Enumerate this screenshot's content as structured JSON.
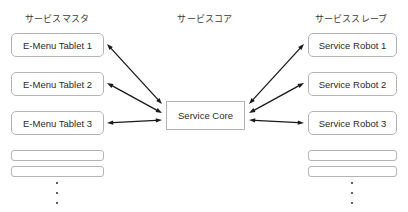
{
  "canvas": {
    "width": 408,
    "height": 212,
    "background": "#ffffff"
  },
  "style": {
    "box_border_color": "#b4b4b4",
    "text_color": "#2b2b2b",
    "header_color": "#3a3a3a",
    "arrow_color": "#1a1a1a"
  },
  "columns": {
    "left": {
      "header": "サービスマスタ",
      "header_x": 57,
      "header_y": 12,
      "nodes": [
        {
          "label": "E-Menu Tablet 1",
          "x": 11,
          "y": 33,
          "w": 93,
          "h": 24,
          "empty": false
        },
        {
          "label": "E-Menu Tablet 2",
          "x": 11,
          "y": 72,
          "w": 93,
          "h": 24,
          "empty": false
        },
        {
          "label": "E-Menu Tablet 3",
          "x": 11,
          "y": 111,
          "w": 93,
          "h": 24,
          "empty": false
        },
        {
          "label": "",
          "x": 11,
          "y": 150,
          "w": 93,
          "h": 11,
          "empty": true
        },
        {
          "label": "",
          "x": 11,
          "y": 166,
          "w": 93,
          "h": 11,
          "empty": true
        }
      ],
      "ellipsis": {
        "x": 57,
        "y": 182,
        "dots": 3
      }
    },
    "center": {
      "header": "サービスコア",
      "header_x": 205,
      "header_y": 12,
      "node": {
        "label": "Service Core",
        "x": 166,
        "y": 101,
        "w": 79,
        "h": 29
      }
    },
    "right": {
      "header": "サービススレーブ",
      "header_x": 351,
      "header_y": 12,
      "nodes": [
        {
          "label": "Service Robot 1",
          "x": 308,
          "y": 33,
          "w": 89,
          "h": 24,
          "empty": false
        },
        {
          "label": "Service Robot 2",
          "x": 308,
          "y": 72,
          "w": 89,
          "h": 24,
          "empty": false
        },
        {
          "label": "Service Robot 3",
          "x": 308,
          "y": 111,
          "w": 89,
          "h": 24,
          "empty": false
        },
        {
          "label": "",
          "x": 308,
          "y": 150,
          "w": 89,
          "h": 11,
          "empty": true
        },
        {
          "label": "",
          "x": 308,
          "y": 166,
          "w": 89,
          "h": 11,
          "empty": true
        }
      ],
      "ellipsis": {
        "x": 352,
        "y": 182,
        "dots": 3
      }
    }
  },
  "connections": [
    {
      "name": "tablet-1-to-core",
      "x1": 107,
      "y1": 44,
      "x2": 162,
      "y2": 104,
      "bidirectional": true
    },
    {
      "name": "tablet-2-to-core",
      "x1": 107,
      "y1": 83,
      "x2": 162,
      "y2": 113,
      "bidirectional": true
    },
    {
      "name": "tablet-3-to-core",
      "x1": 107,
      "y1": 123,
      "x2": 162,
      "y2": 120,
      "bidirectional": true
    },
    {
      "name": "core-to-robot-1",
      "x1": 249,
      "y1": 104,
      "x2": 304,
      "y2": 44,
      "bidirectional": true
    },
    {
      "name": "core-to-robot-2",
      "x1": 249,
      "y1": 113,
      "x2": 304,
      "y2": 83,
      "bidirectional": true
    },
    {
      "name": "core-to-robot-3",
      "x1": 249,
      "y1": 120,
      "x2": 304,
      "y2": 123,
      "bidirectional": true
    }
  ]
}
